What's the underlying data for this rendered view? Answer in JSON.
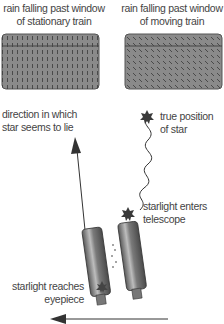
{
  "panels": [
    {
      "caption_line1": "rain falling past window",
      "caption_line2": "of stationary train",
      "rain_direction": "vertical"
    },
    {
      "caption_line1": "rain falling past window",
      "caption_line2": "of moving train",
      "rain_direction": "slanted"
    }
  ],
  "labels": {
    "apparent_direction_line1": "direction in which",
    "apparent_direction_line2": "star seems to lie",
    "true_position_line1": "true position",
    "true_position_line2": "of star",
    "enters_line1": "starlight enters",
    "enters_line2": "telescope",
    "reaches_line1": "starlight reaches",
    "reaches_line2": "eyepiece"
  },
  "colors": {
    "window_fill": "#8a8a8a",
    "window_border": "#555555",
    "telescope_fill": "#6f6f6f",
    "star": "#3a3a3a",
    "arrow": "#333333"
  }
}
